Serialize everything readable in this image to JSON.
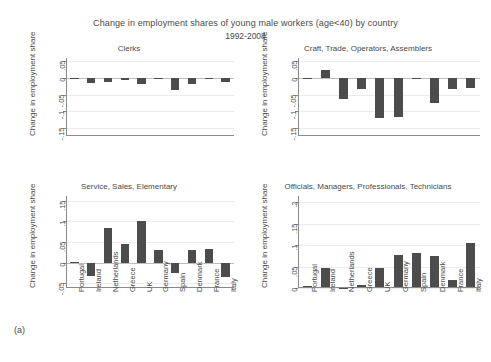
{
  "figure": {
    "title": "Change in employment shares of young male workers (age<40) by country",
    "subtitle": "1992-2008",
    "panel_label": "(a)",
    "bar_color": "#4c4c4c",
    "axis_color": "#8a8a8a",
    "grid_color": "#ececec"
  },
  "countries": [
    "Portugal",
    "Ireland",
    "Netherlands",
    "Greece",
    "UK",
    "Germany",
    "Spain",
    "Denmark",
    "France",
    "Italy"
  ],
  "axis_title": "Change in employment share",
  "chart_data": [
    {
      "type": "bar",
      "title": "Clerks",
      "xlabel": "",
      "ylabel": "Change in employment share",
      "categories": [
        "Portugal",
        "Ireland",
        "Netherlands",
        "Greece",
        "UK",
        "Germany",
        "Spain",
        "Denmark",
        "France",
        "Italy"
      ],
      "values": [
        -0.001,
        -0.016,
        -0.012,
        -0.007,
        -0.017,
        -0.002,
        -0.037,
        -0.017,
        -0.004,
        -0.012
      ],
      "ylim": [
        -0.175,
        0.06
      ],
      "yticks": [
        -0.15,
        -0.1,
        -0.05,
        0,
        0.05
      ],
      "yticklabels": [
        "-.15",
        "-.1",
        "-.05",
        "0",
        ".05"
      ],
      "grid": true,
      "legend": "none"
    },
    {
      "type": "bar",
      "title": "Craft, Trade, Operators, Assemblers",
      "xlabel": "",
      "ylabel": "Change in employment share",
      "categories": [
        "Portugal",
        "Ireland",
        "Netherlands",
        "Greece",
        "UK",
        "Germany",
        "Spain",
        "Denmark",
        "France",
        "Italy"
      ],
      "values": [
        -0.004,
        0.024,
        -0.063,
        -0.034,
        -0.122,
        -0.119,
        -0.002,
        -0.077,
        -0.032,
        -0.031
      ],
      "ylim": [
        -0.175,
        0.06
      ],
      "yticks": [
        -0.15,
        -0.1,
        -0.05,
        0,
        0.05
      ],
      "yticklabels": [
        "-.15",
        "-.1",
        "-.05",
        "0",
        ".05"
      ],
      "grid": true,
      "legend": "none"
    },
    {
      "type": "bar",
      "title": "Service, Sales, Elementary",
      "xlabel": "",
      "ylabel": "Change in employment share",
      "categories": [
        "Portugal",
        "Ireland",
        "Netherlands",
        "Greece",
        "UK",
        "Germany",
        "Spain",
        "Denmark",
        "France",
        "Italy"
      ],
      "values": [
        0.002,
        -0.032,
        0.085,
        0.046,
        0.1,
        0.03,
        -0.026,
        0.031,
        0.032,
        -0.035
      ],
      "ylim": [
        -0.062,
        0.162
      ],
      "yticks": [
        -0.05,
        0,
        0.05,
        0.1,
        0.15
      ],
      "yticklabels": [
        "-.05",
        "0",
        ".05",
        ".1",
        ".15"
      ],
      "grid": true,
      "legend": "none"
    },
    {
      "type": "bar",
      "title": "Officials, Managers, Professionals, Technicians",
      "xlabel": "",
      "ylabel": "Change in employment share",
      "categories": [
        "Portugal",
        "Ireland",
        "Netherlands",
        "Greece",
        "UK",
        "Germany",
        "Spain",
        "Denmark",
        "France",
        "Italy"
      ],
      "values": [
        0.004,
        0.047,
        0.001,
        0.006,
        0.046,
        0.078,
        0.082,
        0.075,
        0.019,
        0.104
      ],
      "ylim": [
        0,
        0.215
      ],
      "yticks": [
        0,
        0.05,
        0.1,
        0.15,
        0.2
      ],
      "yticklabels": [
        "0",
        ".05",
        ".1",
        ".15",
        ".2"
      ],
      "grid": true,
      "legend": "none"
    }
  ]
}
